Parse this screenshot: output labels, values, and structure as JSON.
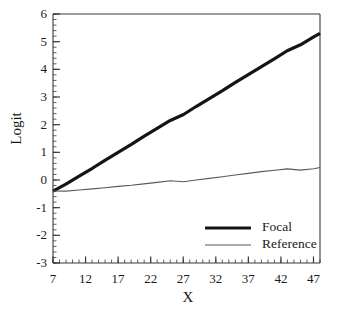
{
  "chart_data": {
    "type": "line",
    "title": "",
    "xlabel": "X",
    "ylabel": "Logit",
    "xlim": [
      7,
      48
    ],
    "ylim": [
      -3,
      6
    ],
    "xticks": [
      7,
      12,
      17,
      22,
      27,
      32,
      37,
      42,
      47
    ],
    "xtick_labels": [
      "7",
      "12",
      "17",
      "22",
      "27",
      "32",
      "37",
      "42",
      "47"
    ],
    "yticks": [
      -3,
      -2,
      -1,
      0,
      1,
      2,
      3,
      4,
      5,
      6
    ],
    "ytick_labels": [
      "-3",
      "-2",
      "-1",
      "0",
      "1",
      "2",
      "3",
      "4",
      "5",
      "6"
    ],
    "x_minor_tick_step": 1,
    "y_minor_tick_step": 0.2,
    "grid": false,
    "legend_position": "inside bottom-right",
    "series": [
      {
        "name": "Focal",
        "color": "#141414",
        "line_width": 3.2,
        "x": [
          7,
          9,
          11,
          13,
          15,
          17,
          19,
          21,
          23,
          25,
          27,
          29,
          31,
          33,
          35,
          37,
          39,
          41,
          43,
          45,
          47,
          48
        ],
        "values": [
          -0.4,
          -0.12,
          0.16,
          0.44,
          0.72,
          1.0,
          1.28,
          1.56,
          1.84,
          2.12,
          2.4,
          2.68,
          2.96,
          3.24,
          3.52,
          3.8,
          4.08,
          4.36,
          4.64,
          4.92,
          5.2,
          5.3
        ]
      },
      {
        "name": "Reference",
        "color": "#5a5a5a",
        "line_width": 1.1,
        "x": [
          7,
          9,
          11,
          13,
          15,
          17,
          19,
          21,
          23,
          25,
          27,
          29,
          31,
          33,
          35,
          37,
          39,
          41,
          43,
          45,
          47,
          48
        ],
        "values": [
          -0.4,
          -0.36,
          -0.33,
          -0.3,
          -0.27,
          -0.23,
          -0.2,
          -0.16,
          -0.12,
          -0.07,
          -0.02,
          0.03,
          0.08,
          0.13,
          0.18,
          0.23,
          0.28,
          0.32,
          0.36,
          0.4,
          0.44,
          0.45
        ]
      }
    ]
  },
  "legend": {
    "entries": [
      {
        "label": "Focal",
        "color": "#141414",
        "line_width": 3.2
      },
      {
        "label": "Reference",
        "color": "#5a5a5a",
        "line_width": 1.1
      }
    ]
  },
  "axes": {
    "frame_color": "#3a3a3a"
  }
}
